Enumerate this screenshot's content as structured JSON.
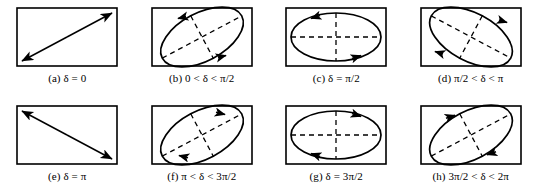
{
  "figure": {
    "type": "diagram-grid",
    "rows": 2,
    "columns": 4,
    "background_color": "#ffffff",
    "line_color": "#000000",
    "panels": [
      {
        "id": "a",
        "label": "(a)",
        "expression": "δ = 0",
        "caption": "(a) δ = 0",
        "shape": "line",
        "line_direction": "bottom-left-to-top-right",
        "arrowheads": "both",
        "axes_dashed": false,
        "rotation_sense": "none"
      },
      {
        "id": "b",
        "label": "(b)",
        "expression": "0 < δ < π/2",
        "caption": "(b) 0 < δ < π/2",
        "shape": "ellipse",
        "tilt": "major-axis-up-right",
        "tilt_degrees": -28,
        "axes_dashed": true,
        "rotation_sense": "counterclockwise",
        "arrowheads": "two"
      },
      {
        "id": "c",
        "label": "(c)",
        "expression": "δ = π/2",
        "caption": "(c) δ = π/2",
        "shape": "ellipse",
        "tilt": "axis-aligned",
        "tilt_degrees": 0,
        "axes_dashed": true,
        "rotation_sense": "counterclockwise",
        "arrowheads": "two"
      },
      {
        "id": "d",
        "label": "(d)",
        "expression": "π/2 < δ < π",
        "caption": "(d)  π/2 < δ < π",
        "shape": "ellipse",
        "tilt": "major-axis-down-right",
        "tilt_degrees": 28,
        "axes_dashed": true,
        "rotation_sense": "counterclockwise",
        "arrowheads": "two"
      },
      {
        "id": "e",
        "label": "(e)",
        "expression": "δ = π",
        "caption": "(e)  δ = π",
        "shape": "line",
        "line_direction": "top-left-to-bottom-right",
        "arrowheads": "both",
        "axes_dashed": false,
        "rotation_sense": "none"
      },
      {
        "id": "f",
        "label": "(f)",
        "expression": "π < δ < 3π/2",
        "caption": "(f) π < δ < 3π/2",
        "shape": "ellipse",
        "tilt": "major-axis-up-right",
        "tilt_degrees": -28,
        "axes_dashed": true,
        "rotation_sense": "clockwise",
        "arrowheads": "two"
      },
      {
        "id": "g",
        "label": "(g)",
        "expression": "δ = 3π/2",
        "caption": "(g)  δ = 3π/2",
        "shape": "ellipse",
        "tilt": "axis-aligned",
        "tilt_degrees": 0,
        "axes_dashed": true,
        "rotation_sense": "clockwise",
        "arrowheads": "two"
      },
      {
        "id": "h",
        "label": "(h)",
        "expression": "3π/2 < δ < 2π",
        "caption": "(h)  3π/2 < δ < 2π",
        "shape": "ellipse",
        "tilt": "major-axis-up-right",
        "tilt_degrees": -28,
        "axes_dashed": true,
        "rotation_sense": "clockwise",
        "arrowheads": "two"
      }
    ]
  }
}
